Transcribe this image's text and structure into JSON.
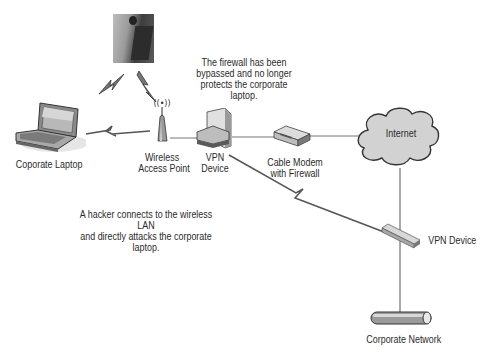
{
  "diagram": {
    "nodes": {
      "hacker": {
        "label": "",
        "icon": "hacker-photo"
      },
      "laptop": {
        "label": "Coporate Laptop",
        "icon": "laptop-icon"
      },
      "access_point": {
        "label_line1": "Wireless",
        "label_line2": "Access Point",
        "icon": "wireless-access-point-icon"
      },
      "vpn_left": {
        "label_line1": "VPN",
        "label_line2": "Device",
        "icon": "vpn-device-icon"
      },
      "cable_modem": {
        "label_line1": "Cable Modem",
        "label_line2": "with Firewall",
        "icon": "cable-modem-icon"
      },
      "internet": {
        "label": "Internet",
        "icon": "cloud-icon"
      },
      "vpn_right": {
        "label": "VPN Device",
        "icon": "vpn-device-icon"
      },
      "corporate_network": {
        "label": "Corporate Network",
        "icon": "network-bus-icon"
      }
    },
    "notes": {
      "firewall_line1": "The firewall has been",
      "firewall_line2": "bypassed and no longer",
      "firewall_line3": "protects the corporate",
      "firewall_line4": "laptop.",
      "hacker_line1": "A hacker connects to the wireless LAN",
      "hacker_line2": "and directly attacks the corporate",
      "hacker_line3": "laptop."
    },
    "colors": {
      "line": "#6a6a6a",
      "cloud_fill": "#d4d4d4",
      "cloud_stroke": "#3a3a3a",
      "device_fill": "#cfcfcf",
      "text": "#2b2b2b"
    }
  }
}
